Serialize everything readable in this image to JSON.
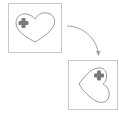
{
  "diagram": {
    "colors": {
      "frame": "#c8c8c8",
      "heart_stroke": "#9a9a9a",
      "cross": "#7a7a7a",
      "arrow": "#a0a0a0",
      "background": "#ffffff"
    },
    "source_panel": {
      "shape": "heart",
      "marker": "cross",
      "orientation": "upright"
    },
    "target_panel": {
      "shape": "heart",
      "marker": "cross",
      "orientation": "rotated"
    },
    "arrow": {
      "direction": "source-to-target",
      "style": "curved"
    }
  }
}
